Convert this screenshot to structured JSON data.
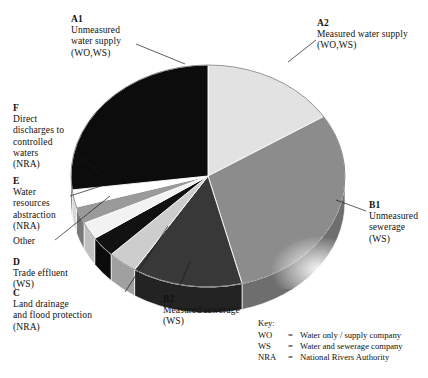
{
  "figure": {
    "center": {
      "x": 208,
      "y": 176
    },
    "radius": {
      "rx": 137,
      "ry": 111
    },
    "depth_px": 26
  },
  "labels": [
    {
      "id": "A1",
      "code": "A1",
      "lines": [
        "Unmeasured",
        "water supply",
        "(WO,WS)"
      ],
      "x": 71,
      "y": 14,
      "leader": [
        [
          136,
          44
        ],
        [
          185,
          64
        ]
      ]
    },
    {
      "id": "A2",
      "code": "A2",
      "lines": [
        "Measured water supply",
        "(WO,WS)"
      ],
      "x": 317,
      "y": 18,
      "leader": [
        [
          316,
          40
        ],
        [
          288,
          62
        ]
      ]
    },
    {
      "id": "F",
      "code": "F",
      "lines": [
        "Direct",
        "discharges to",
        "controlled",
        "waters",
        "(NRA)"
      ],
      "x": 13,
      "y": 103,
      "leader": [
        [
          80,
          156
        ],
        [
          105,
          178
        ]
      ]
    },
    {
      "id": "E",
      "code": "E",
      "lines": [
        "Water",
        "resources",
        "abstraction",
        "(NRA)"
      ],
      "x": 13,
      "y": 176,
      "leader": [
        [
          70,
          196
        ],
        [
          101,
          186
        ]
      ]
    },
    {
      "id": "Other",
      "code": "",
      "lines": [
        "Other"
      ],
      "x": 13,
      "y": 236,
      "leader": [
        [
          55,
          240
        ],
        [
          110,
          196
        ]
      ]
    },
    {
      "id": "D",
      "code": "D",
      "lines": [
        "Trade effluent",
        "(WS)"
      ],
      "x": 13,
      "y": 257,
      "leader": [
        [
          100,
          262
        ],
        [
          140,
          214
        ]
      ]
    },
    {
      "id": "C",
      "code": "C",
      "lines": [
        "Land drainage",
        "and flood protection",
        "(NRA)"
      ],
      "x": 13,
      "y": 288,
      "leader": [
        [
          125,
          292
        ],
        [
          168,
          226
        ]
      ]
    },
    {
      "id": "B2",
      "code": "B2",
      "lines": [
        "Measured sewerage",
        "(WS)"
      ],
      "x": 163,
      "y": 294,
      "leader": [
        [
          177,
          292
        ],
        [
          190,
          262
        ]
      ]
    },
    {
      "id": "B1",
      "code": "B1",
      "lines": [
        "Unmeasured",
        "sewerage",
        "(WS)"
      ],
      "x": 369,
      "y": 200,
      "leader": [
        [
          366,
          211
        ],
        [
          336,
          200
        ]
      ]
    }
  ],
  "key": {
    "title": "Key:",
    "rows": [
      {
        "abbr": "WO",
        "eq": "=",
        "desc": "Water only / supply company"
      },
      {
        "abbr": "WS",
        "eq": "=",
        "desc": "Water and sewerage company"
      },
      {
        "abbr": "NRA",
        "eq": "=",
        "desc": "National Rivers Authority"
      }
    ],
    "x": 258,
    "y": 318
  },
  "chart_data": {
    "type": "pie",
    "labels_position": "callout-with-leader-lines",
    "legend": "Key: WO = Water only / supply company; WS = Water and sewerage company; NRA = National Rivers Authority",
    "start_angle_deg": -90,
    "direction": "clockwise",
    "three_d": true,
    "categories": [
      "A2 Measured water supply (WO,WS)",
      "B1 Unmeasured sewerage (WS)",
      "B2 Measured sewerage (WS)",
      "C Land drainage and flood protection (NRA)",
      "D Trade effluent (WS)",
      "Other",
      "E Water resources abstraction (NRA)",
      "F Direct discharges to controlled waters (NRA)",
      "A1 Unmeasured water supply (WO,WS)"
    ],
    "values": [
      16,
      30,
      13,
      3.5,
      3,
      2.5,
      2.5,
      2.5,
      27
    ],
    "colors": [
      "#e2e2e2",
      "#8c8c8c",
      "#383838",
      "#cdcdcd",
      "#111111",
      "#f2f2f2",
      "#9a9a9a",
      "#ffffff",
      "#0c0c0c"
    ],
    "side_colors": [
      "#b4b4b4",
      "#6e6e6e",
      "#232323",
      "#a0a0a0",
      "#0a0a0a",
      "#c0c0c0",
      "#787878",
      "#d8d8d8",
      "#050505"
    ],
    "xlabel": "",
    "ylabel": ""
  }
}
